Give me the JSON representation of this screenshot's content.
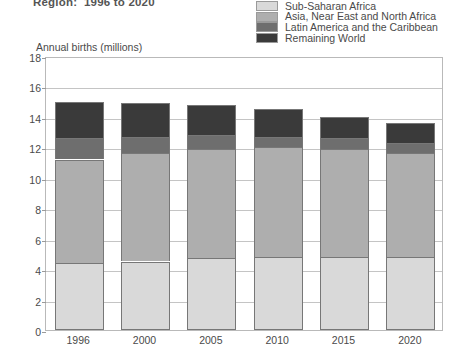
{
  "chart_data": {
    "type": "bar",
    "subtype": "stacked-bar",
    "title": "Region:  1996 to 2020",
    "xlabel": "",
    "ylabel": "Annual births (millions)",
    "ylim": [
      0,
      18
    ],
    "ytick_step": 2,
    "yticks": [
      0,
      2,
      4,
      6,
      8,
      10,
      12,
      14,
      16,
      18
    ],
    "grid": true,
    "legend_position": "top-right",
    "categories": [
      "1996",
      "2000",
      "2005",
      "2010",
      "2015",
      "2020"
    ],
    "series": [
      {
        "name": "Sub-Saharan Africa",
        "color": "#d9d9d9",
        "values": [
          4.4,
          4.5,
          4.7,
          4.8,
          4.8,
          4.8
        ]
      },
      {
        "name": "Asia, Near East and North Africa",
        "color": "#aeaeae",
        "values": [
          6.8,
          7.1,
          7.2,
          7.2,
          7.1,
          6.8
        ]
      },
      {
        "name": "Latin America and the Caribbean",
        "color": "#6e6e6e",
        "values": [
          1.4,
          1.1,
          0.9,
          0.7,
          0.7,
          0.7
        ]
      },
      {
        "name": "Remaining World",
        "color": "#3a3a3a",
        "values": [
          2.4,
          2.2,
          2.0,
          1.8,
          1.4,
          1.3
        ]
      }
    ],
    "totals": [
      15.0,
      14.9,
      14.8,
      14.5,
      14.0,
      13.6
    ],
    "stack_tops": {
      "sub_saharan_africa": [
        4.4,
        4.5,
        4.7,
        4.8,
        4.8,
        4.8
      ],
      "asia_near_east_north_africa": [
        11.2,
        11.6,
        11.9,
        12.0,
        11.9,
        11.6
      ],
      "latin_america_caribbean": [
        12.6,
        12.7,
        12.8,
        12.7,
        12.6,
        12.3
      ],
      "remaining_world": [
        15.0,
        14.9,
        14.8,
        14.5,
        14.0,
        13.6
      ]
    }
  },
  "legend": {
    "items": [
      {
        "label": "Sub-Saharan Africa",
        "color": "#d9d9d9"
      },
      {
        "label": "Asia, Near East and North Africa",
        "color": "#aeaeae"
      },
      {
        "label": "Latin America and the Caribbean",
        "color": "#6e6e6e"
      },
      {
        "label": "Remaining World",
        "color": "#3a3a3a"
      }
    ]
  }
}
